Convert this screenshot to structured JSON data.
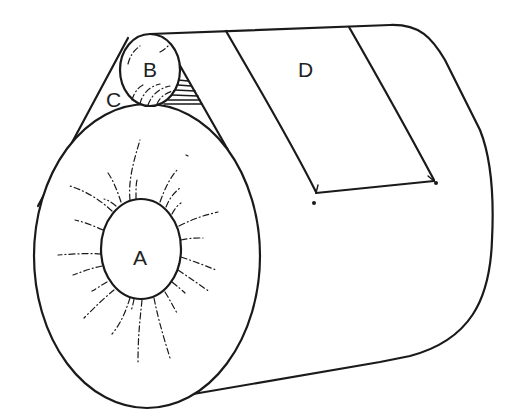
{
  "diagram": {
    "type": "line-drawing",
    "labels": {
      "A": "A",
      "B": "B",
      "C": "C",
      "D": "D"
    },
    "colors": {
      "line": "#1a1a1a",
      "background": "#ffffff"
    }
  }
}
